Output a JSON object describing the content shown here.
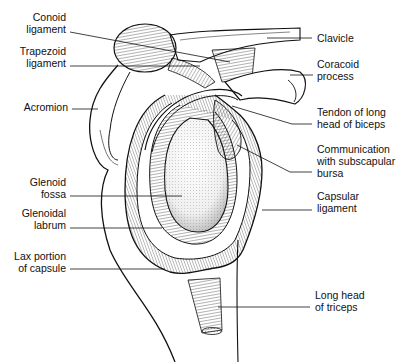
{
  "diagram": {
    "labels_left": [
      {
        "id": "conoid-ligament",
        "lines": [
          "Conoid",
          "ligament"
        ]
      },
      {
        "id": "trapezoid-ligament",
        "lines": [
          "Trapezoid",
          "ligament"
        ]
      },
      {
        "id": "acromion",
        "lines": [
          "Acromion"
        ]
      },
      {
        "id": "glenoid-fossa",
        "lines": [
          "Glenoid",
          "fossa"
        ]
      },
      {
        "id": "glenoidal-labrum",
        "lines": [
          "Glenoidal",
          "labrum"
        ]
      },
      {
        "id": "lax-portion-of-capsule",
        "lines": [
          "Lax portion",
          "of capsule"
        ]
      }
    ],
    "labels_right": [
      {
        "id": "clavicle",
        "lines": [
          "Clavicle"
        ]
      },
      {
        "id": "coracoid-process",
        "lines": [
          "Coracoid",
          "process"
        ]
      },
      {
        "id": "tendon-long-head-biceps",
        "lines": [
          "Tendon of long",
          "head of biceps"
        ]
      },
      {
        "id": "communication-subscapular-bursa",
        "lines": [
          "Communication",
          "with subscapular",
          "bursa"
        ]
      },
      {
        "id": "capsular-ligament",
        "lines": [
          "Capsular",
          "ligament"
        ]
      },
      {
        "id": "long-head-triceps",
        "lines": [
          "Long head",
          "of triceps"
        ]
      }
    ],
    "colors": {
      "ink": "#111111",
      "background": "#ffffff"
    }
  }
}
